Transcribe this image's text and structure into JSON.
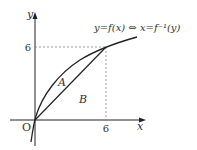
{
  "diagram": {
    "axes": {
      "x_label": "x",
      "y_label": "y",
      "origin_label": "O"
    },
    "ticks": {
      "x_tick": "6",
      "y_tick": "6"
    },
    "curve_label": "y=f(x) ⇔ x=f⁻¹(y)",
    "regions": {
      "a": "A",
      "b": "B"
    },
    "colors": {
      "line": "#222222",
      "dashed": "#888888",
      "text": "#333333"
    }
  }
}
